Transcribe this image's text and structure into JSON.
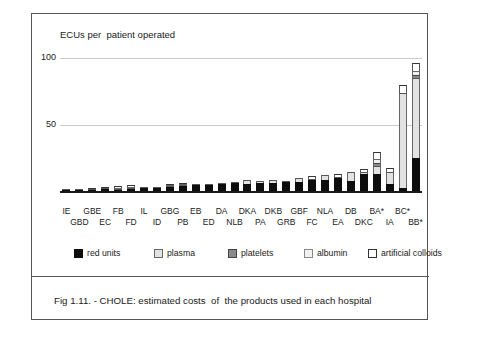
{
  "figure": {
    "caption": "Fig 1.11. - CHOLE: estimated costs  of  the products used in each hospital",
    "y_axis_title": "ECUs per  patient operated"
  },
  "axis": {
    "ticks": [
      {
        "label": "100",
        "value": 100
      },
      {
        "label": "50",
        "value": 50
      }
    ]
  },
  "legend": {
    "items": [
      {
        "label": "red units",
        "key": "red_units",
        "swatch": "sw-red",
        "color": "#0d0d0d"
      },
      {
        "label": "plasma",
        "key": "plasma",
        "swatch": "sw-plasma",
        "color": "#e2e2e2"
      },
      {
        "label": "platelets",
        "key": "platelets",
        "swatch": "sw-plate",
        "color": "#8a8a8a"
      },
      {
        "label": "albumin",
        "key": "albumin",
        "swatch": "sw-alb",
        "color": "#f2f2f2"
      },
      {
        "label": "artificial colloids",
        "key": "artificial_colloids",
        "swatch": "sw-art",
        "color": "#ffffff"
      }
    ]
  },
  "chart_data": {
    "type": "bar",
    "title": "Fig 1.11. - CHOLE: estimated costs  of  the products used in each hospital",
    "subtitle": "",
    "xlabel": "",
    "ylabel": "ECUs per  patient operated",
    "ylim": [
      0,
      100
    ],
    "yticks": [
      50,
      100
    ],
    "grid": true,
    "stacked": true,
    "legend_position": "bottom",
    "categories": [
      "IE",
      "GBD",
      "GBE",
      "EC",
      "FB",
      "FD",
      "IL",
      "ID",
      "GBG",
      "PB",
      "EB",
      "ED",
      "DA",
      "NLB",
      "DKA",
      "PA",
      "DKB",
      "GRB",
      "GBF",
      "FC",
      "NLA",
      "EA",
      "DB",
      "DKC",
      "BA*",
      "IA",
      "BC*",
      "BB*"
    ],
    "series": [
      {
        "name": "red units",
        "color": "#0d0d0d",
        "values": [
          0.4,
          0.6,
          1.0,
          1.2,
          1.0,
          1.2,
          2.2,
          2.6,
          3.0,
          3.4,
          4.2,
          4.6,
          5.4,
          5.8,
          5.6,
          6.4,
          6.2,
          7.0,
          6.6,
          8.4,
          8.0,
          9.6,
          7.4,
          12.6,
          13.0,
          5.0,
          2.0,
          25.0
        ]
      },
      {
        "name": "plasma",
        "color": "#e2e2e2",
        "values": [
          0.3,
          0.4,
          0.5,
          0.6,
          0.8,
          1.0,
          0.3,
          0.4,
          0.5,
          0.6,
          0.4,
          0.5,
          0.6,
          0.6,
          2.6,
          0.8,
          2.0,
          0.8,
          3.2,
          1.0,
          4.4,
          1.2,
          6.6,
          1.6,
          6.0,
          9.6,
          72.0,
          60.0
        ]
      },
      {
        "name": "platelets",
        "color": "#8a8a8a",
        "values": [
          0,
          0,
          0,
          0,
          0,
          0,
          0,
          0,
          0,
          0,
          0,
          0,
          0,
          0,
          0,
          0,
          0,
          0,
          0,
          0,
          0,
          0,
          0,
          0,
          2.0,
          0,
          0,
          2.0
        ]
      },
      {
        "name": "albumin",
        "color": "#f2f2f2",
        "values": [
          0,
          0,
          0,
          0,
          0.4,
          0.5,
          0,
          0,
          0.6,
          0.6,
          0,
          0,
          0,
          0,
          0,
          0,
          0,
          0,
          0,
          0,
          0,
          0,
          0,
          0,
          3.0,
          0,
          0,
          3.0
        ]
      },
      {
        "name": "artificial colloids",
        "color": "#ffffff",
        "values": [
          0,
          0,
          0.6,
          0.8,
          1.0,
          1.2,
          0,
          0,
          1.0,
          1.2,
          0,
          0,
          0,
          0,
          0,
          0,
          0,
          0,
          0,
          1.6,
          0,
          2.0,
          0,
          2.2,
          5.0,
          3.0,
          6.0,
          6.0
        ]
      }
    ],
    "totals": [
      0.7,
      1.0,
      2.1,
      2.6,
      3.2,
      3.9,
      2.5,
      3.0,
      5.1,
      5.8,
      4.6,
      5.1,
      6.0,
      6.4,
      8.2,
      7.2,
      8.2,
      7.8,
      9.8,
      11.0,
      12.4,
      12.8,
      14.0,
      16.4,
      29.0,
      17.6,
      80.0,
      96.0
    ]
  }
}
